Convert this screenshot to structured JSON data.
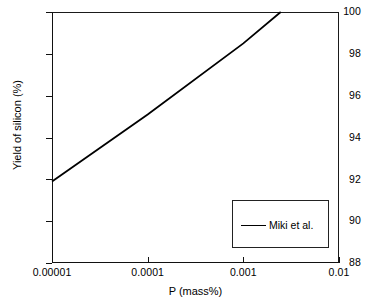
{
  "chart_data": {
    "type": "line",
    "title": "",
    "xlabel": "P (mass%)",
    "ylabel": "Yield of silicon (%)",
    "xscale": "log",
    "yscale": "linear",
    "xlim": [
      1e-05,
      0.01
    ],
    "ylim": [
      88,
      100
    ],
    "grid": false,
    "legend_position": "center-right",
    "xticks": [
      {
        "value": 1e-05,
        "label": "0.00001"
      },
      {
        "value": 0.0001,
        "label": "0.0001"
      },
      {
        "value": 0.001,
        "label": "0.001"
      },
      {
        "value": 0.01,
        "label": "0.01"
      }
    ],
    "yticks": [
      {
        "value": 88,
        "label": "88"
      },
      {
        "value": 90,
        "label": "90"
      },
      {
        "value": 92,
        "label": "92"
      },
      {
        "value": 94,
        "label": "94"
      },
      {
        "value": 96,
        "label": "96"
      },
      {
        "value": 98,
        "label": "98"
      },
      {
        "value": 100,
        "label": "100"
      }
    ],
    "series": [
      {
        "name": "Miki et al.",
        "color": "#000000",
        "style": "solid",
        "x": [
          1e-05,
          0.0001,
          0.001,
          0.00246
        ],
        "y": [
          91.9,
          95.1,
          98.5,
          100.0
        ]
      }
    ],
    "annotations": []
  },
  "legend": {
    "entries": [
      {
        "label": "Miki et al."
      }
    ]
  }
}
